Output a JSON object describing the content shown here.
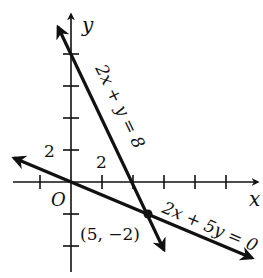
{
  "figure": {
    "type": "coordinate-graph",
    "axes": {
      "x_label": "x",
      "y_label": "y",
      "origin_label": "O",
      "x_tick_label": "2",
      "y_tick_label": "2",
      "tick_spacing_units": 1
    },
    "lines": [
      {
        "equation": "2x + y = 8",
        "label": "2x + y = 8"
      },
      {
        "equation": "2x + 5y = 0",
        "label": "2x + 5y = 0"
      }
    ],
    "intersection": {
      "label": "(5, −2)",
      "x": 5,
      "y": -2
    },
    "colors": {
      "ink": "#111111",
      "background": "#ffffff"
    }
  }
}
